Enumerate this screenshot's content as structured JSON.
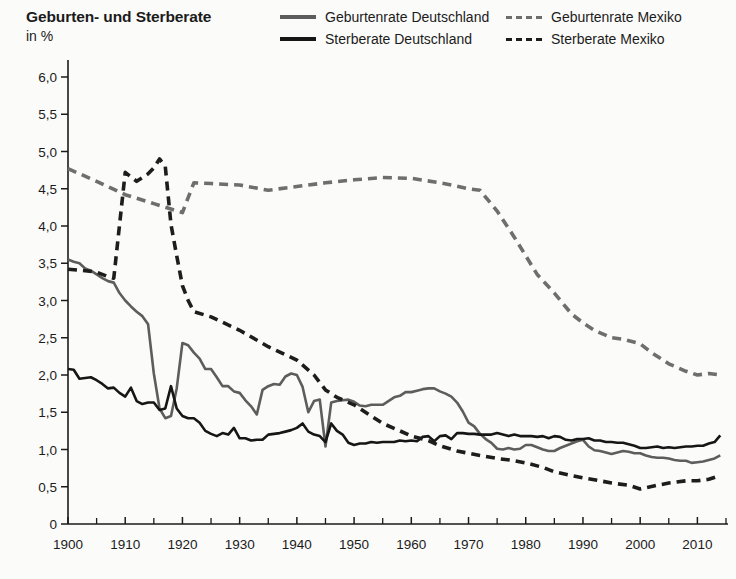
{
  "header": {
    "title": "Geburten- und Sterberate",
    "subtitle": "in %"
  },
  "legend": {
    "items": [
      {
        "label": "Geburtenrate Deutschland",
        "style": "solid-gray",
        "color": "#5d5d5d"
      },
      {
        "label": "Geburtenrate Mexiko",
        "style": "dash-gray",
        "color": "#6e6e6e"
      },
      {
        "label": "Sterberate Deutschland",
        "style": "solid-dark",
        "color": "#161616"
      },
      {
        "label": "Sterberate Mexiko",
        "style": "dash-dark",
        "color": "#1d1d1d"
      }
    ]
  },
  "chart_data": {
    "type": "line",
    "title": "Geburten- und Sterberate",
    "subtitle": "in %",
    "xlabel": "",
    "ylabel": "in %",
    "xlim": [
      1900,
      2015
    ],
    "ylim": [
      0,
      6.0
    ],
    "grid": false,
    "legend_position": "top-right",
    "yticks": [
      "0",
      "0,5",
      "1,0",
      "1,5",
      "2,0",
      "2,5",
      "3,0",
      "3,5",
      "4,0",
      "4,5",
      "5,0",
      "5,5",
      "6,0"
    ],
    "ytick_values": [
      0,
      0.5,
      1.0,
      1.5,
      2.0,
      2.5,
      3.0,
      3.5,
      4.0,
      4.5,
      5.0,
      5.5,
      6.0
    ],
    "xticks": [
      "1900",
      "1910",
      "1920",
      "1930",
      "1940",
      "1950",
      "1960",
      "1970",
      "1980",
      "1990",
      "2000",
      "2010"
    ],
    "xtick_values": [
      1900,
      1910,
      1920,
      1930,
      1940,
      1950,
      1960,
      1970,
      1980,
      1990,
      2000,
      2010
    ],
    "xminor_values": [
      1905,
      1915,
      1925,
      1935,
      1945,
      1955,
      1965,
      1975,
      1985,
      1995,
      2005,
      2015
    ],
    "series": [
      {
        "name": "Geburtenrate Deutschland",
        "style": "solid",
        "color": "#5d5d5d",
        "x": [
          1900,
          1901,
          1902,
          1903,
          1904,
          1905,
          1906,
          1907,
          1908,
          1909,
          1910,
          1911,
          1912,
          1913,
          1914,
          1915,
          1916,
          1917,
          1918,
          1919,
          1920,
          1921,
          1922,
          1923,
          1924,
          1925,
          1926,
          1927,
          1928,
          1929,
          1930,
          1931,
          1932,
          1933,
          1934,
          1935,
          1936,
          1937,
          1938,
          1939,
          1940,
          1941,
          1942,
          1943,
          1944,
          1945,
          1946,
          1947,
          1948,
          1949,
          1950,
          1951,
          1952,
          1953,
          1954,
          1955,
          1956,
          1957,
          1958,
          1959,
          1960,
          1961,
          1962,
          1963,
          1964,
          1965,
          1966,
          1967,
          1968,
          1969,
          1970,
          1971,
          1972,
          1973,
          1974,
          1975,
          1976,
          1977,
          1978,
          1979,
          1980,
          1981,
          1982,
          1983,
          1984,
          1985,
          1986,
          1987,
          1988,
          1989,
          1990,
          1991,
          1992,
          1993,
          1994,
          1995,
          1996,
          1997,
          1998,
          1999,
          2000,
          2001,
          2002,
          2003,
          2004,
          2005,
          2006,
          2007,
          2008,
          2009,
          2010,
          2011,
          2012,
          2013,
          2014
        ],
        "y": [
          3.55,
          3.52,
          3.5,
          3.43,
          3.4,
          3.35,
          3.3,
          3.26,
          3.24,
          3.1,
          3.0,
          2.92,
          2.85,
          2.79,
          2.68,
          2.02,
          1.55,
          1.42,
          1.45,
          1.82,
          2.43,
          2.4,
          2.3,
          2.22,
          2.08,
          2.08,
          1.97,
          1.85,
          1.85,
          1.78,
          1.76,
          1.66,
          1.58,
          1.47,
          1.8,
          1.85,
          1.88,
          1.87,
          1.98,
          2.02,
          2.0,
          1.84,
          1.5,
          1.65,
          1.67,
          1.04,
          1.63,
          1.65,
          1.66,
          1.67,
          1.64,
          1.59,
          1.58,
          1.6,
          1.6,
          1.6,
          1.65,
          1.7,
          1.72,
          1.77,
          1.77,
          1.79,
          1.81,
          1.82,
          1.82,
          1.78,
          1.75,
          1.71,
          1.63,
          1.51,
          1.36,
          1.31,
          1.21,
          1.14,
          1.09,
          1.01,
          1.0,
          1.02,
          1.0,
          1.01,
          1.06,
          1.06,
          1.03,
          1.0,
          0.98,
          0.98,
          1.02,
          1.05,
          1.08,
          1.11,
          1.13,
          1.04,
          0.99,
          0.98,
          0.96,
          0.94,
          0.96,
          0.98,
          0.97,
          0.95,
          0.95,
          0.92,
          0.9,
          0.89,
          0.89,
          0.88,
          0.86,
          0.85,
          0.85,
          0.82,
          0.83,
          0.84,
          0.86,
          0.88,
          0.92
        ]
      },
      {
        "name": "Sterberate Deutschland",
        "style": "solid",
        "color": "#161616",
        "x": [
          1900,
          1901,
          1902,
          1903,
          1904,
          1905,
          1906,
          1907,
          1908,
          1909,
          1910,
          1911,
          1912,
          1913,
          1914,
          1915,
          1916,
          1917,
          1918,
          1919,
          1920,
          1921,
          1922,
          1923,
          1924,
          1925,
          1926,
          1927,
          1928,
          1929,
          1930,
          1931,
          1932,
          1933,
          1934,
          1935,
          1936,
          1937,
          1938,
          1939,
          1940,
          1941,
          1942,
          1943,
          1944,
          1945,
          1946,
          1947,
          1948,
          1949,
          1950,
          1951,
          1952,
          1953,
          1954,
          1955,
          1956,
          1957,
          1958,
          1959,
          1960,
          1961,
          1962,
          1963,
          1964,
          1965,
          1966,
          1967,
          1968,
          1969,
          1970,
          1971,
          1972,
          1973,
          1974,
          1975,
          1976,
          1977,
          1978,
          1979,
          1980,
          1981,
          1982,
          1983,
          1984,
          1985,
          1986,
          1987,
          1988,
          1989,
          1990,
          1991,
          1992,
          1993,
          1994,
          1995,
          1996,
          1997,
          1998,
          1999,
          2000,
          2001,
          2002,
          2003,
          2004,
          2005,
          2006,
          2007,
          2008,
          2009,
          2010,
          2011,
          2012,
          2013,
          2014
        ],
        "y": [
          2.08,
          2.07,
          1.95,
          1.96,
          1.97,
          1.93,
          1.88,
          1.82,
          1.83,
          1.76,
          1.71,
          1.83,
          1.65,
          1.61,
          1.63,
          1.63,
          1.53,
          1.55,
          1.85,
          1.55,
          1.45,
          1.42,
          1.42,
          1.36,
          1.25,
          1.21,
          1.18,
          1.22,
          1.2,
          1.29,
          1.15,
          1.15,
          1.12,
          1.13,
          1.13,
          1.2,
          1.21,
          1.22,
          1.24,
          1.26,
          1.29,
          1.35,
          1.24,
          1.2,
          1.18,
          1.1,
          1.35,
          1.25,
          1.2,
          1.09,
          1.06,
          1.08,
          1.08,
          1.1,
          1.09,
          1.1,
          1.1,
          1.1,
          1.12,
          1.11,
          1.12,
          1.11,
          1.17,
          1.18,
          1.11,
          1.18,
          1.19,
          1.14,
          1.22,
          1.22,
          1.21,
          1.21,
          1.2,
          1.2,
          1.2,
          1.22,
          1.2,
          1.18,
          1.2,
          1.18,
          1.18,
          1.18,
          1.17,
          1.18,
          1.15,
          1.18,
          1.17,
          1.13,
          1.12,
          1.14,
          1.14,
          1.15,
          1.12,
          1.12,
          1.1,
          1.1,
          1.09,
          1.09,
          1.07,
          1.05,
          1.02,
          1.02,
          1.03,
          1.04,
          1.02,
          1.03,
          1.02,
          1.03,
          1.04,
          1.04,
          1.05,
          1.05,
          1.08,
          1.1,
          1.19
        ]
      },
      {
        "name": "Geburtenrate Mexiko",
        "style": "dashed",
        "color": "#6e6e6e",
        "x": [
          1900,
          1905,
          1910,
          1915,
          1920,
          1922,
          1925,
          1930,
          1935,
          1940,
          1945,
          1950,
          1955,
          1960,
          1965,
          1967,
          1970,
          1972,
          1975,
          1978,
          1980,
          1982,
          1985,
          1988,
          1990,
          1992,
          1995,
          1997,
          2000,
          2002,
          2005,
          2008,
          2010,
          2012,
          2014
        ],
        "y": [
          4.77,
          4.6,
          4.42,
          4.3,
          4.18,
          4.58,
          4.57,
          4.55,
          4.48,
          4.53,
          4.58,
          4.62,
          4.65,
          4.64,
          4.58,
          4.55,
          4.5,
          4.48,
          4.2,
          3.85,
          3.6,
          3.35,
          3.1,
          2.82,
          2.7,
          2.6,
          2.5,
          2.48,
          2.42,
          2.3,
          2.15,
          2.05,
          2.0,
          2.02,
          2.0
        ]
      },
      {
        "name": "Sterberate Mexiko",
        "style": "dashed",
        "color": "#1d1d1d",
        "x": [
          1900,
          1903,
          1905,
          1907,
          1908,
          1910,
          1912,
          1914,
          1915,
          1916,
          1917,
          1918,
          1919,
          1920,
          1921,
          1922,
          1925,
          1930,
          1935,
          1940,
          1943,
          1945,
          1947,
          1950,
          1953,
          1955,
          1958,
          1960,
          1963,
          1965,
          1968,
          1970,
          1972,
          1975,
          1978,
          1980,
          1983,
          1985,
          1988,
          1990,
          1993,
          1995,
          1998,
          2000,
          2003,
          2005,
          2008,
          2010,
          2012,
          2014
        ],
        "y": [
          3.42,
          3.4,
          3.38,
          3.32,
          3.3,
          4.72,
          4.6,
          4.7,
          4.78,
          4.9,
          4.8,
          4.02,
          3.6,
          3.2,
          3.0,
          2.85,
          2.78,
          2.6,
          2.38,
          2.2,
          2.0,
          1.8,
          1.7,
          1.6,
          1.45,
          1.35,
          1.25,
          1.18,
          1.12,
          1.05,
          0.98,
          0.95,
          0.92,
          0.88,
          0.85,
          0.82,
          0.76,
          0.7,
          0.65,
          0.62,
          0.58,
          0.55,
          0.52,
          0.47,
          0.52,
          0.55,
          0.58,
          0.58,
          0.6,
          0.65
        ]
      }
    ]
  }
}
